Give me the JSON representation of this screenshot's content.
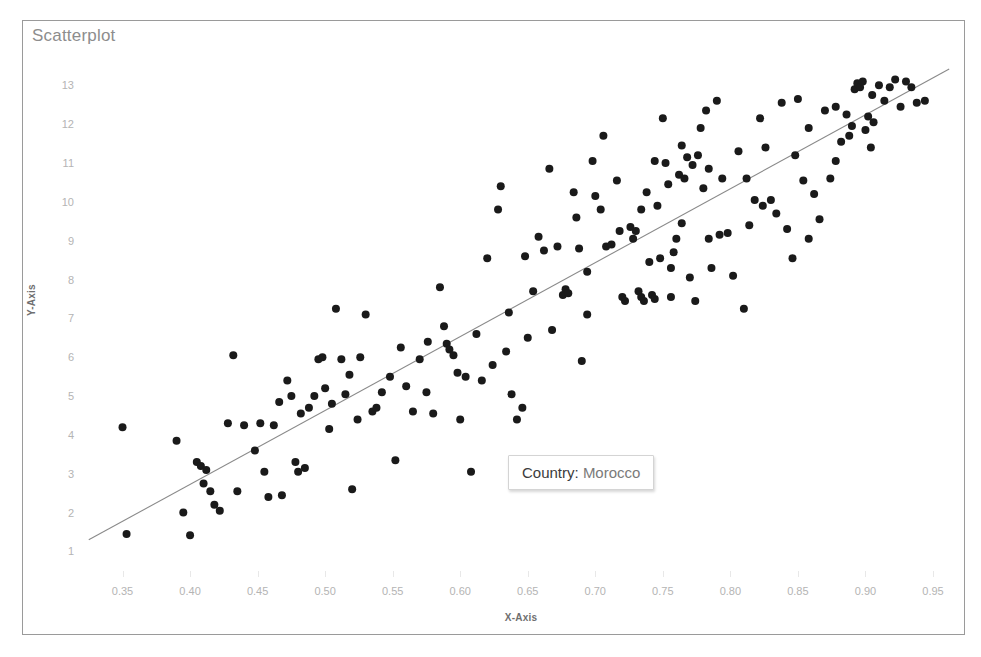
{
  "chart": {
    "title": "Scatterplot",
    "xlabel": "X-Axis",
    "ylabel": "Y-Axis"
  },
  "tooltip": {
    "key": "Country:",
    "value": "Morocco"
  },
  "chart_data": {
    "type": "scatter",
    "title": "Scatterplot",
    "xlabel": "X-Axis",
    "ylabel": "Y-Axis",
    "xlim": [
      0.32,
      0.97
    ],
    "ylim": [
      0.6,
      13.6
    ],
    "xticks": [
      0.35,
      0.4,
      0.45,
      0.5,
      0.55,
      0.6,
      0.65,
      0.7,
      0.75,
      0.8,
      0.85,
      0.9,
      0.95
    ],
    "yticks": [
      1,
      2,
      3,
      4,
      5,
      6,
      7,
      8,
      9,
      10,
      11,
      12,
      13
    ],
    "xtick_labels": [
      "0.35",
      "0.40",
      "0.45",
      "0.50",
      "0.55",
      "0.60",
      "0.65",
      "0.70",
      "0.75",
      "0.80",
      "0.85",
      "0.90",
      "0.95"
    ],
    "ytick_labels": [
      "1",
      "2",
      "3",
      "4",
      "5",
      "6",
      "7",
      "8",
      "9",
      "10",
      "11",
      "12",
      "13"
    ],
    "grid": false,
    "legend": false,
    "marker_color": "#1a1a1a",
    "marker_size": 8,
    "trendline": {
      "type": "linear",
      "color": "#8a8a8a",
      "x": [
        0.325,
        0.962
      ],
      "y": [
        1.3,
        13.42
      ]
    },
    "points": [
      [
        0.35,
        4.2
      ],
      [
        0.353,
        1.45
      ],
      [
        0.39,
        3.85
      ],
      [
        0.395,
        2.0
      ],
      [
        0.4,
        1.42
      ],
      [
        0.405,
        3.3
      ],
      [
        0.408,
        3.2
      ],
      [
        0.41,
        2.75
      ],
      [
        0.412,
        3.1
      ],
      [
        0.415,
        2.55
      ],
      [
        0.418,
        2.2
      ],
      [
        0.422,
        2.05
      ],
      [
        0.428,
        4.3
      ],
      [
        0.432,
        6.05
      ],
      [
        0.435,
        2.55
      ],
      [
        0.44,
        4.25
      ],
      [
        0.448,
        3.6
      ],
      [
        0.452,
        4.3
      ],
      [
        0.455,
        3.05
      ],
      [
        0.458,
        2.4
      ],
      [
        0.462,
        4.25
      ],
      [
        0.468,
        2.45
      ],
      [
        0.472,
        5.4
      ],
      [
        0.475,
        5.0
      ],
      [
        0.478,
        3.3
      ],
      [
        0.48,
        3.05
      ],
      [
        0.482,
        4.55
      ],
      [
        0.485,
        3.15
      ],
      [
        0.488,
        4.7
      ],
      [
        0.492,
        5.0
      ],
      [
        0.495,
        5.95
      ],
      [
        0.498,
        6.0
      ],
      [
        0.5,
        5.2
      ],
      [
        0.503,
        4.15
      ],
      [
        0.505,
        4.8
      ],
      [
        0.508,
        7.25
      ],
      [
        0.512,
        5.95
      ],
      [
        0.515,
        5.05
      ],
      [
        0.518,
        5.55
      ],
      [
        0.52,
        2.6
      ],
      [
        0.524,
        4.4
      ],
      [
        0.53,
        7.1
      ],
      [
        0.535,
        4.6
      ],
      [
        0.538,
        4.7
      ],
      [
        0.542,
        5.1
      ],
      [
        0.548,
        5.5
      ],
      [
        0.552,
        3.35
      ],
      [
        0.556,
        6.25
      ],
      [
        0.56,
        5.25
      ],
      [
        0.565,
        4.6
      ],
      [
        0.57,
        5.95
      ],
      [
        0.575,
        5.1
      ],
      [
        0.58,
        4.55
      ],
      [
        0.585,
        7.8
      ],
      [
        0.588,
        6.8
      ],
      [
        0.59,
        6.35
      ],
      [
        0.592,
        6.2
      ],
      [
        0.595,
        6.05
      ],
      [
        0.598,
        5.6
      ],
      [
        0.6,
        4.4
      ],
      [
        0.604,
        5.5
      ],
      [
        0.608,
        3.05
      ],
      [
        0.612,
        6.6
      ],
      [
        0.616,
        5.4
      ],
      [
        0.62,
        8.55
      ],
      [
        0.624,
        5.8
      ],
      [
        0.628,
        9.8
      ],
      [
        0.63,
        10.4
      ],
      [
        0.634,
        6.15
      ],
      [
        0.638,
        5.05
      ],
      [
        0.642,
        4.4
      ],
      [
        0.646,
        4.7
      ],
      [
        0.65,
        6.5
      ],
      [
        0.654,
        7.7
      ],
      [
        0.658,
        9.1
      ],
      [
        0.662,
        8.75
      ],
      [
        0.666,
        10.85
      ],
      [
        0.668,
        6.7
      ],
      [
        0.672,
        8.85
      ],
      [
        0.676,
        7.6
      ],
      [
        0.678,
        7.75
      ],
      [
        0.68,
        7.65
      ],
      [
        0.684,
        10.25
      ],
      [
        0.688,
        8.8
      ],
      [
        0.69,
        5.9
      ],
      [
        0.694,
        7.1
      ],
      [
        0.698,
        11.05
      ],
      [
        0.7,
        10.15
      ],
      [
        0.704,
        9.8
      ],
      [
        0.708,
        8.85
      ],
      [
        0.712,
        8.9
      ],
      [
        0.716,
        10.55
      ],
      [
        0.718,
        9.25
      ],
      [
        0.72,
        7.55
      ],
      [
        0.722,
        7.45
      ],
      [
        0.726,
        9.35
      ],
      [
        0.728,
        9.05
      ],
      [
        0.73,
        9.25
      ],
      [
        0.732,
        7.7
      ],
      [
        0.734,
        7.55
      ],
      [
        0.736,
        7.45
      ],
      [
        0.738,
        10.25
      ],
      [
        0.74,
        8.45
      ],
      [
        0.742,
        7.6
      ],
      [
        0.744,
        7.5
      ],
      [
        0.746,
        9.9
      ],
      [
        0.748,
        8.55
      ],
      [
        0.75,
        12.15
      ],
      [
        0.752,
        11.0
      ],
      [
        0.754,
        10.45
      ],
      [
        0.756,
        8.3
      ],
      [
        0.758,
        8.7
      ],
      [
        0.76,
        9.05
      ],
      [
        0.762,
        10.7
      ],
      [
        0.764,
        11.45
      ],
      [
        0.766,
        10.6
      ],
      [
        0.768,
        11.15
      ],
      [
        0.77,
        8.05
      ],
      [
        0.772,
        10.95
      ],
      [
        0.774,
        7.45
      ],
      [
        0.776,
        11.2
      ],
      [
        0.778,
        11.9
      ],
      [
        0.78,
        10.35
      ],
      [
        0.782,
        12.35
      ],
      [
        0.784,
        9.05
      ],
      [
        0.786,
        8.3
      ],
      [
        0.79,
        12.6
      ],
      [
        0.794,
        10.6
      ],
      [
        0.798,
        9.2
      ],
      [
        0.802,
        8.1
      ],
      [
        0.806,
        11.3
      ],
      [
        0.81,
        7.25
      ],
      [
        0.814,
        9.4
      ],
      [
        0.818,
        10.05
      ],
      [
        0.822,
        12.15
      ],
      [
        0.826,
        11.4
      ],
      [
        0.83,
        10.05
      ],
      [
        0.834,
        9.7
      ],
      [
        0.838,
        12.55
      ],
      [
        0.842,
        9.3
      ],
      [
        0.846,
        8.55
      ],
      [
        0.85,
        12.65
      ],
      [
        0.854,
        10.55
      ],
      [
        0.858,
        11.9
      ],
      [
        0.862,
        10.2
      ],
      [
        0.866,
        9.55
      ],
      [
        0.87,
        12.35
      ],
      [
        0.874,
        10.6
      ],
      [
        0.878,
        11.05
      ],
      [
        0.882,
        11.55
      ],
      [
        0.886,
        12.25
      ],
      [
        0.888,
        11.7
      ],
      [
        0.89,
        11.95
      ],
      [
        0.892,
        12.9
      ],
      [
        0.894,
        13.05
      ],
      [
        0.896,
        12.95
      ],
      [
        0.898,
        13.1
      ],
      [
        0.9,
        11.85
      ],
      [
        0.902,
        12.2
      ],
      [
        0.904,
        11.4
      ],
      [
        0.906,
        12.05
      ],
      [
        0.91,
        13.0
      ],
      [
        0.914,
        12.6
      ],
      [
        0.918,
        12.95
      ],
      [
        0.922,
        13.15
      ],
      [
        0.926,
        12.45
      ],
      [
        0.93,
        13.1
      ],
      [
        0.934,
        12.95
      ],
      [
        0.938,
        12.55
      ],
      [
        0.944,
        12.6
      ],
      [
        0.466,
        4.85
      ],
      [
        0.526,
        6.0
      ],
      [
        0.576,
        6.4
      ],
      [
        0.636,
        7.15
      ],
      [
        0.686,
        9.6
      ],
      [
        0.706,
        11.7
      ],
      [
        0.744,
        11.05
      ],
      [
        0.764,
        9.45
      ],
      [
        0.784,
        10.85
      ],
      [
        0.824,
        9.9
      ],
      [
        0.858,
        9.05
      ],
      [
        0.878,
        12.45
      ],
      [
        0.905,
        12.75
      ],
      [
        0.648,
        8.6
      ],
      [
        0.694,
        8.2
      ],
      [
        0.734,
        9.8
      ],
      [
        0.756,
        7.55
      ],
      [
        0.792,
        9.15
      ],
      [
        0.812,
        10.6
      ],
      [
        0.848,
        11.2
      ]
    ]
  }
}
